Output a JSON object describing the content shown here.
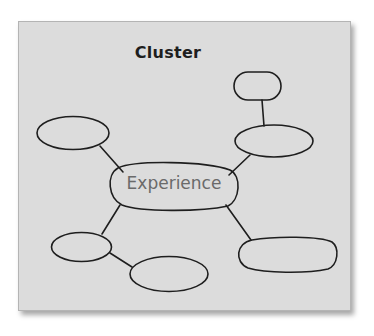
{
  "diagram": {
    "title": "Cluster",
    "type": "cluster-map",
    "panel": {
      "background": "#dcdcdc",
      "stroke": "#1e1e1e"
    },
    "center_node": {
      "label": "Experience",
      "label_color": "#6a6a6a"
    },
    "nodes": [
      {
        "id": "top-right-small",
        "label": ""
      },
      {
        "id": "right-middle",
        "label": ""
      },
      {
        "id": "upper-left",
        "label": ""
      },
      {
        "id": "lower-left",
        "label": ""
      },
      {
        "id": "bottom-center",
        "label": ""
      },
      {
        "id": "bottom-right",
        "label": ""
      }
    ],
    "edges": [
      {
        "from": "Experience",
        "to": "upper-left"
      },
      {
        "from": "Experience",
        "to": "right-middle"
      },
      {
        "from": "right-middle",
        "to": "top-right-small"
      },
      {
        "from": "Experience",
        "to": "lower-left"
      },
      {
        "from": "lower-left",
        "to": "bottom-center"
      },
      {
        "from": "Experience",
        "to": "bottom-right"
      }
    ]
  }
}
